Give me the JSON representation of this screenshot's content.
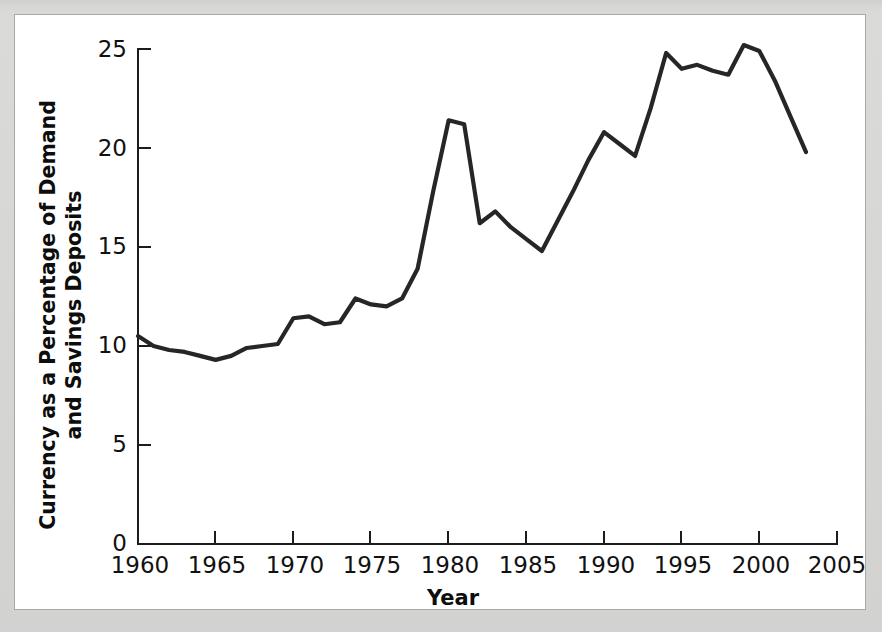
{
  "figure": {
    "background_color": "#ffffff",
    "page_color": "#d6d6d4",
    "frame_color": "#a8a8a6",
    "line_color": "#262626",
    "axis_color": "#1c1c1c"
  },
  "chart_data": {
    "type": "line",
    "title": "",
    "subtitle": "",
    "xlabel": "Year",
    "ylabel": "Currency as a Percentage of Demand and Savings Deposits",
    "ylabel_line1": "Currency as a Percentage of Demand",
    "ylabel_line2": "and Savings Deposits",
    "xlim": [
      1960,
      2005
    ],
    "ylim": [
      0,
      25
    ],
    "xticks": [
      1960,
      1965,
      1970,
      1975,
      1980,
      1985,
      1990,
      1995,
      2000,
      2005
    ],
    "xtick_labels": [
      "1960",
      "1965",
      "1970",
      "1975",
      "1980",
      "1985",
      "1990",
      "1995",
      "2000",
      "2005"
    ],
    "yticks": [
      0,
      5,
      10,
      15,
      20,
      25
    ],
    "ytick_labels": [
      "0",
      "5",
      "10",
      "15",
      "20",
      "25"
    ],
    "grid": false,
    "legend": null,
    "legend_position": "none",
    "series": [
      {
        "name": "Currency as a Percentage of Demand and Savings Deposits",
        "color": "#262626",
        "x": [
          1960,
          1961,
          1962,
          1963,
          1964,
          1965,
          1966,
          1967,
          1968,
          1969,
          1970,
          1971,
          1972,
          1973,
          1974,
          1975,
          1976,
          1977,
          1978,
          1979,
          1980,
          1981,
          1982,
          1983,
          1984,
          1985,
          1986,
          1987,
          1988,
          1989,
          1990,
          1991,
          1992,
          1993,
          1994,
          1995,
          1996,
          1997,
          1998,
          1999,
          2000,
          2001,
          2002,
          2003
        ],
        "values": [
          10.5,
          10.0,
          9.8,
          9.7,
          9.5,
          9.3,
          9.5,
          9.9,
          10.0,
          10.1,
          11.4,
          11.5,
          11.1,
          11.2,
          12.4,
          12.1,
          12.0,
          12.4,
          13.9,
          17.8,
          21.4,
          21.2,
          16.2,
          16.8,
          16.0,
          15.4,
          14.8,
          16.3,
          17.8,
          19.4,
          20.8,
          20.2,
          19.6,
          22.0,
          24.8,
          24.0,
          24.2,
          23.9,
          23.7,
          25.2,
          24.9,
          23.4,
          21.6,
          19.8
        ]
      }
    ]
  },
  "axis": {
    "x_title": "Year",
    "y_title_line1": "Currency as a Percentage of Demand",
    "y_title_line2": "and Savings Deposits"
  }
}
